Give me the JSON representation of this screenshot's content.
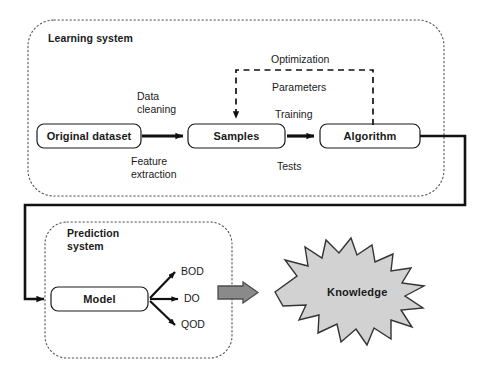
{
  "diagram": {
    "colors": {
      "stroke": "#1a1a1a",
      "dotted_container": "#555555",
      "burst_fill": "#d2d2d2",
      "burst_stroke": "#333333",
      "block_arrow_fill": "#8a8a8a",
      "block_arrow_stroke": "#4d4d4d",
      "background": "#ffffff"
    },
    "containers": [
      {
        "id": "learning-system",
        "label": "Learning system",
        "border": "dotted",
        "x": 28,
        "y": 20,
        "w": 416,
        "h": 176
      },
      {
        "id": "prediction-system",
        "label_line1": "Prediction",
        "label_line2": "system",
        "border": "dotted",
        "x": 45,
        "y": 222,
        "w": 187,
        "h": 136
      }
    ],
    "nodes": [
      {
        "id": "original-dataset",
        "label": "Original dataset",
        "x": 37,
        "y": 124,
        "w": 104,
        "h": 24
      },
      {
        "id": "samples",
        "label": "Samples",
        "x": 188,
        "y": 124,
        "w": 97,
        "h": 24
      },
      {
        "id": "algorithm",
        "label": "Algorithm",
        "x": 320,
        "y": 124,
        "w": 100,
        "h": 24
      },
      {
        "id": "model",
        "label": "Model",
        "x": 51,
        "y": 287,
        "w": 97,
        "h": 24
      }
    ],
    "edge_labels": [
      {
        "id": "data-cleaning",
        "line1": "Data",
        "line2": "cleaning",
        "x": 137,
        "y": 90
      },
      {
        "id": "feature-extraction",
        "line1": "Feature",
        "line2": "extraction",
        "x": 131,
        "y": 155
      },
      {
        "id": "optimization",
        "line1": "Optimization",
        "x": 271,
        "y": 53
      },
      {
        "id": "parameters",
        "line1": "Parameters",
        "x": 272,
        "y": 81
      },
      {
        "id": "training",
        "line1": "Training",
        "x": 275,
        "y": 108
      },
      {
        "id": "tests",
        "line1": "Tests",
        "x": 277,
        "y": 160
      }
    ],
    "outputs": [
      {
        "id": "bod",
        "label": "BOD",
        "x": 181,
        "y": 265
      },
      {
        "id": "do",
        "label": "DO",
        "x": 184,
        "y": 292
      },
      {
        "id": "qod",
        "label": "QOD",
        "x": 181,
        "y": 318
      }
    ],
    "burst": {
      "id": "knowledge",
      "label": "Knowledge",
      "cx": 365,
      "cy": 292,
      "label_x": 327,
      "label_y": 286
    },
    "block_arrow": {
      "id": "knowledge-block-arrow",
      "x": 218,
      "y": 282,
      "w": 40,
      "h": 21
    }
  }
}
